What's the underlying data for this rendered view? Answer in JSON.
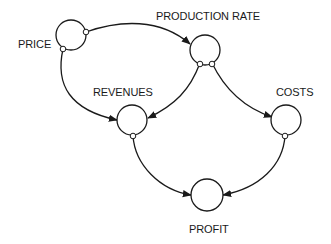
{
  "diagram": {
    "type": "causal-flow",
    "colors": {
      "stroke": "#1a1a1a",
      "background": "#ffffff"
    },
    "nodes": [
      {
        "id": "price",
        "label": "PRICE"
      },
      {
        "id": "production_rate",
        "label": "PRODUCTION RATE"
      },
      {
        "id": "revenues",
        "label": "REVENUES"
      },
      {
        "id": "costs",
        "label": "COSTS"
      },
      {
        "id": "profit",
        "label": "PROFIT"
      }
    ],
    "edges": [
      {
        "from": "PRICE",
        "to": "PRODUCTION RATE"
      },
      {
        "from": "PRICE",
        "to": "REVENUES"
      },
      {
        "from": "PRODUCTION RATE",
        "to": "REVENUES"
      },
      {
        "from": "PRODUCTION RATE",
        "to": "COSTS"
      },
      {
        "from": "REVENUES",
        "to": "PROFIT"
      },
      {
        "from": "COSTS",
        "to": "PROFIT"
      }
    ]
  }
}
